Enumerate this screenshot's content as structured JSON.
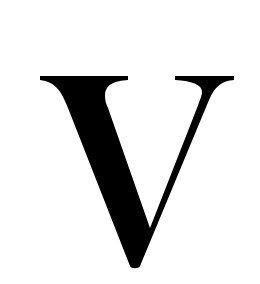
{
  "glyph": {
    "character": "V",
    "color": "#000000",
    "background": "#ffffff"
  }
}
